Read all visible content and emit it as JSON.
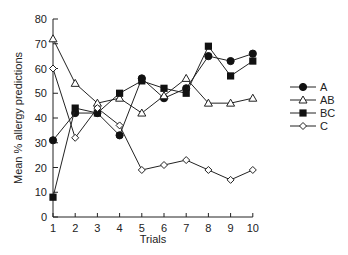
{
  "chart_data": {
    "type": "line",
    "title": "",
    "xlabel": "Trials",
    "ylabel": "Mean % allergy predictions",
    "x": [
      1,
      2,
      3,
      4,
      5,
      6,
      7,
      8,
      9,
      10
    ],
    "xlim": [
      1,
      10
    ],
    "ylim": [
      0,
      80
    ],
    "yticks": [
      0,
      10,
      20,
      30,
      40,
      50,
      60,
      70,
      80
    ],
    "xticks": [
      1,
      2,
      3,
      4,
      5,
      6,
      7,
      8,
      9,
      10
    ],
    "grid": false,
    "legend_position": "right",
    "series": [
      {
        "name": "A",
        "marker": "filled-circle",
        "values": [
          31,
          42,
          42,
          33,
          56,
          48,
          52,
          65,
          63,
          66
        ]
      },
      {
        "name": "AB",
        "marker": "open-triangle",
        "values": [
          72,
          54,
          46,
          48,
          42,
          49,
          56,
          46,
          46,
          48
        ]
      },
      {
        "name": "BC",
        "marker": "filled-square",
        "values": [
          8,
          44,
          42,
          50,
          55,
          52,
          50,
          69,
          57,
          63
        ]
      },
      {
        "name": "C",
        "marker": "open-diamond",
        "values": [
          60,
          32,
          44,
          37,
          19,
          21,
          23,
          19,
          15,
          19
        ]
      }
    ]
  },
  "colors": {
    "line": "#222222",
    "fill": "#111111",
    "background": "#ffffff"
  }
}
